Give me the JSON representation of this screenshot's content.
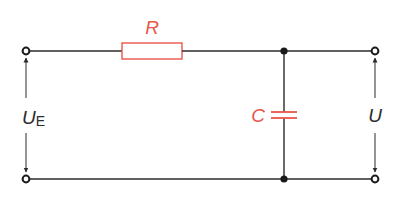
{
  "diagram": {
    "type": "RC low-pass circuit",
    "colors": {
      "wire": "#2b2b2b",
      "component": "#e8564a",
      "background": "#ffffff"
    },
    "components": {
      "resistor": {
        "label": "R"
      },
      "capacitor": {
        "label": "C"
      }
    },
    "voltages": {
      "input": {
        "symbol": "U",
        "subscript": "E"
      },
      "output": {
        "symbol": "U"
      }
    },
    "terminals": [
      "input-top",
      "input-bottom",
      "output-top",
      "output-bottom"
    ],
    "junctions": [
      "top-junction",
      "bottom-junction"
    ]
  }
}
